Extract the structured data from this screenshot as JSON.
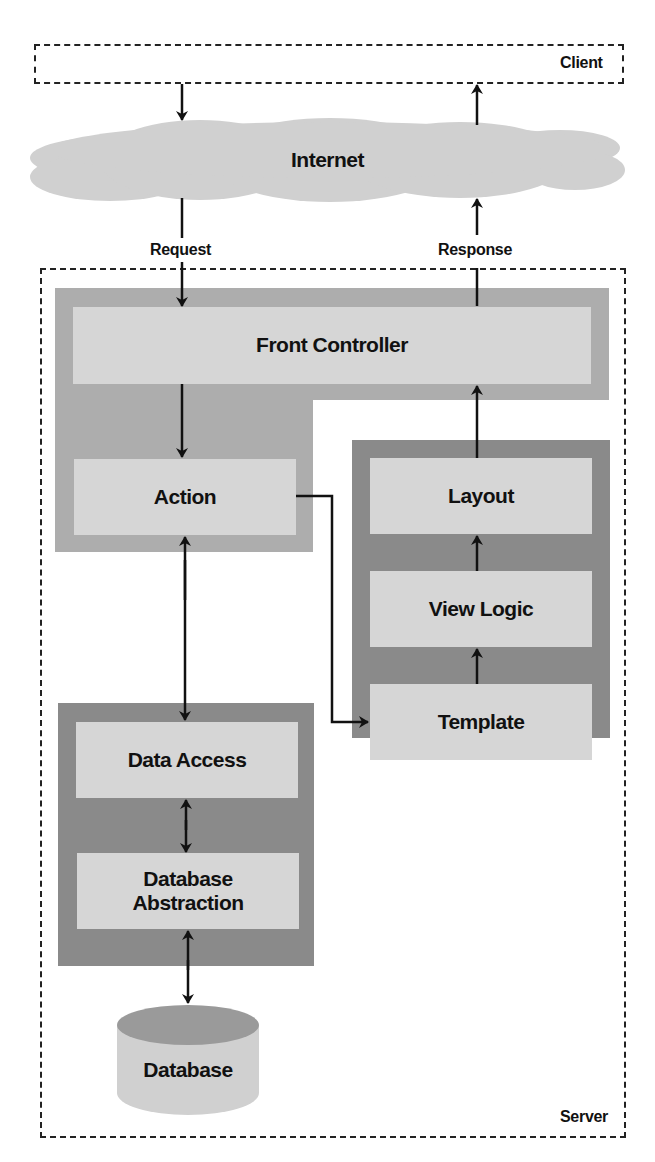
{
  "diagram": {
    "client": {
      "label": "Client"
    },
    "server": {
      "label": "Server"
    },
    "internet": {
      "label": "Internet"
    },
    "edges": {
      "request": "Request",
      "response": "Response"
    },
    "controller_group": {
      "front_controller": "Front Controller",
      "action": "Action"
    },
    "view_group": {
      "layout": "Layout",
      "view_logic": "View Logic",
      "template": "Template"
    },
    "model_group": {
      "data_access": "Data Access",
      "database_abstraction": "Database Abstraction"
    },
    "database": {
      "label": "Database"
    },
    "colors": {
      "light_panel": "#adadad",
      "dark_panel": "#8a8a8a",
      "box_fill": "#d6d6d6",
      "cloud_fill": "#d0d0d0",
      "line": "#111111"
    }
  }
}
